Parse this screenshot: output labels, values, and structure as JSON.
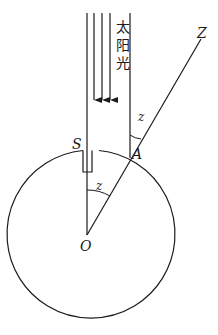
{
  "diagram": {
    "labels": {
      "sunlight": [
        "太",
        "阳",
        "光"
      ],
      "well": "S",
      "observation_point": "A",
      "center": "O",
      "zenith": "Z",
      "angle_at_A": "z",
      "angle_at_O": "z"
    },
    "colors": {
      "stroke": "#1a1a1a",
      "background": "#ffffff"
    },
    "ray_count": 3
  }
}
